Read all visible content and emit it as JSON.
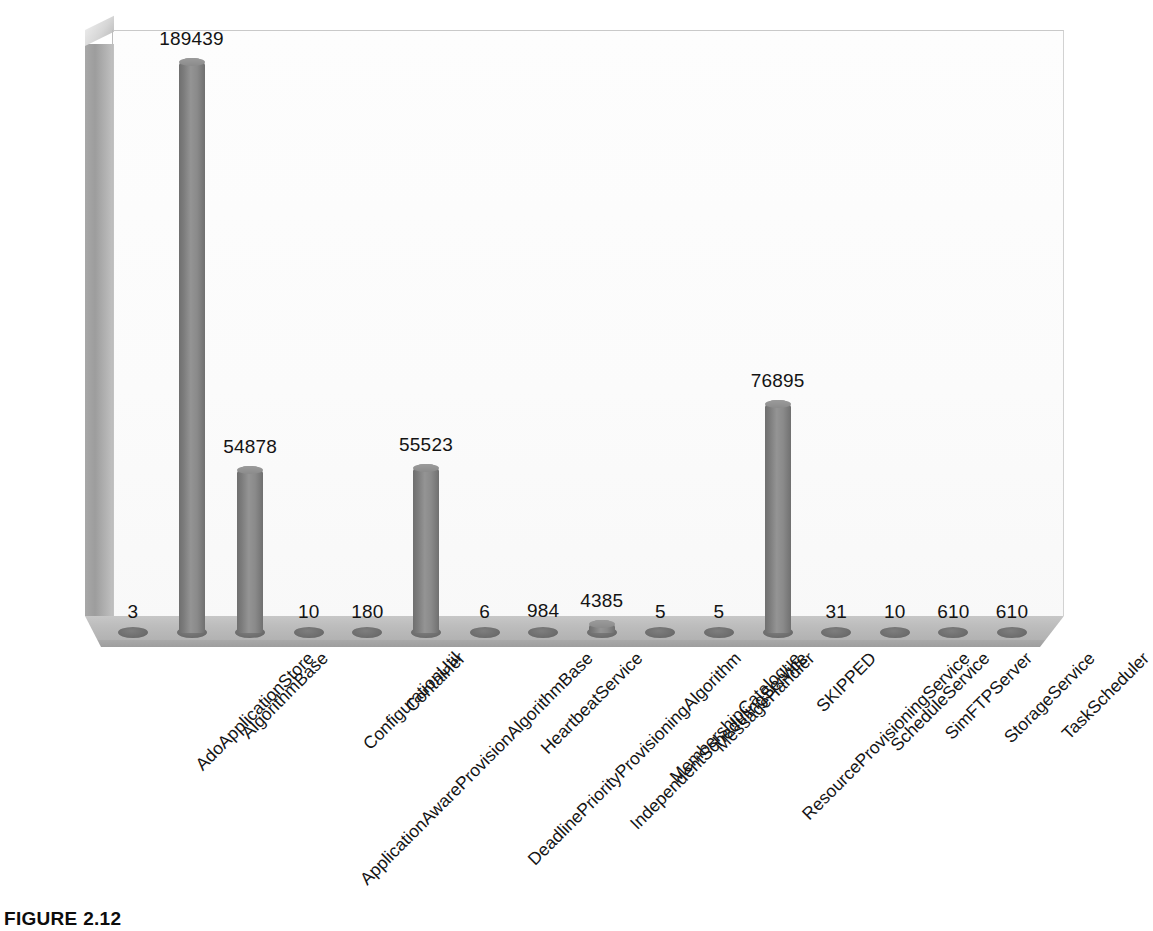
{
  "figure": {
    "caption": "FIGURE 2.12"
  },
  "chart_data": {
    "type": "bar",
    "title": "",
    "xlabel": "",
    "ylabel": "",
    "ylim": [
      0,
      189439
    ],
    "grid": false,
    "legend": null,
    "style": "3d-cylinder",
    "bar_color": "#8a8a8a",
    "categories": [
      "AdoApplicationStore",
      "AlgorithmBase",
      "ApplicationAwareProvisionAlgorithmBase",
      "ConfigurationUtil",
      "Container",
      "DeadlinePriorityProvisioningAlgorithm",
      "HeartbeatService",
      "IndependentSchedulingService",
      "MembershipCatalogue",
      "MessageHandler",
      "ResourceProvisioningService",
      "SKIPPED",
      "ScheduleService",
      "SimFTPServer",
      "StorageService",
      "TaskScheduler"
    ],
    "values": [
      3,
      189439,
      54878,
      10,
      180,
      55523,
      6,
      984,
      4385,
      5,
      5,
      76895,
      31,
      10,
      610,
      610
    ],
    "value_labels": [
      "3",
      "189439",
      "54878",
      "10",
      "180",
      "55523",
      "6",
      "984",
      "4385",
      "5",
      "5",
      "76895",
      "31",
      "10",
      "610",
      "610"
    ]
  }
}
